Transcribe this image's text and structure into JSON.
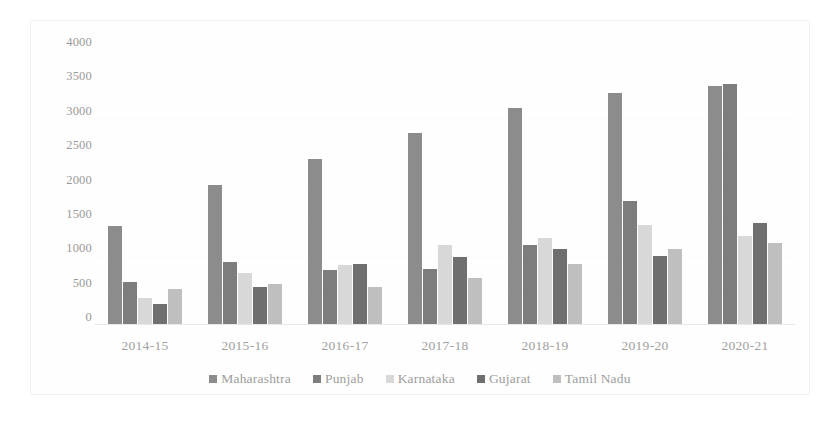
{
  "chart_data": {
    "type": "bar",
    "title": "",
    "subtitle": "",
    "xlabel": "",
    "ylabel": "",
    "ylim": [
      0,
      4000
    ],
    "ytick_labels": [
      "4000",
      "3500",
      "3000",
      "2500",
      "2000",
      "1500",
      "1000",
      "500",
      "0"
    ],
    "ytick_values": [
      4000,
      3500,
      3000,
      2500,
      2000,
      1500,
      1000,
      500,
      0
    ],
    "grid": true,
    "legend_position": "bottom",
    "categories": [
      "2014-15",
      "2015-16",
      "2016-17",
      "2017-18",
      "2018-19",
      "2019-20",
      "2020-21"
    ],
    "series": [
      {
        "name": "Maharashtra",
        "color": "#8c8c8c",
        "values": [
          1440,
          2030,
          2420,
          2800,
          3160,
          3370,
          3480
        ]
      },
      {
        "name": "Punjab",
        "color": "#7d7d7d",
        "values": [
          620,
          920,
          800,
          820,
          1170,
          1810,
          3510
        ]
      },
      {
        "name": "Karnataka",
        "color": "#d8d8d8",
        "values": [
          400,
          760,
          880,
          1160,
          1270,
          1450,
          1300
        ]
      },
      {
        "name": "Gujarat",
        "color": "#6f6f6f",
        "values": [
          300,
          560,
          890,
          990,
          1110,
          1010,
          1490
        ]
      },
      {
        "name": "Tamil Nadu",
        "color": "#bfbfbf",
        "values": [
          530,
          600,
          560,
          680,
          890,
          1100,
          1200
        ]
      }
    ]
  }
}
